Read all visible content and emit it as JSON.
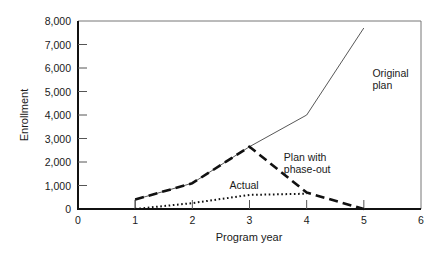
{
  "chart_data": {
    "type": "line",
    "title": "",
    "xlabel": "Program year",
    "ylabel": "Enrollment",
    "xlim": [
      0,
      6
    ],
    "ylim": [
      0,
      8000
    ],
    "x_ticks": [
      0,
      1,
      2,
      3,
      4,
      5,
      6
    ],
    "y_ticks": [
      0,
      1000,
      2000,
      3000,
      4000,
      5000,
      6000,
      7000,
      8000
    ],
    "y_tick_labels": [
      "0",
      "1,000",
      "2,000",
      "3,000",
      "4,000",
      "5,000",
      "6,000",
      "7,000",
      "8,000"
    ],
    "grid": false,
    "legend": "inline annotations",
    "series": [
      {
        "name": "Original plan",
        "style": "thin solid",
        "x": [
          1,
          2,
          3,
          4,
          5
        ],
        "values": [
          400,
          1100,
          2650,
          4000,
          7700
        ]
      },
      {
        "name": "Plan with phase-out",
        "style": "thick dashed",
        "x": [
          1,
          2,
          3,
          4,
          5
        ],
        "values": [
          400,
          1100,
          2650,
          700,
          0
        ]
      },
      {
        "name": "Actual",
        "style": "dotted",
        "x": [
          1,
          2,
          3,
          4
        ],
        "values": [
          0,
          250,
          600,
          650
        ]
      }
    ],
    "annotations": [
      {
        "text_lines": [
          "Original",
          "plan"
        ],
        "x": 5.15,
        "y": 5600
      },
      {
        "text_lines": [
          "Plan with",
          "phase-out"
        ],
        "x": 3.6,
        "y": 2050
      },
      {
        "text_lines": [
          "Actual"
        ],
        "x": 2.65,
        "y": 850
      }
    ]
  }
}
